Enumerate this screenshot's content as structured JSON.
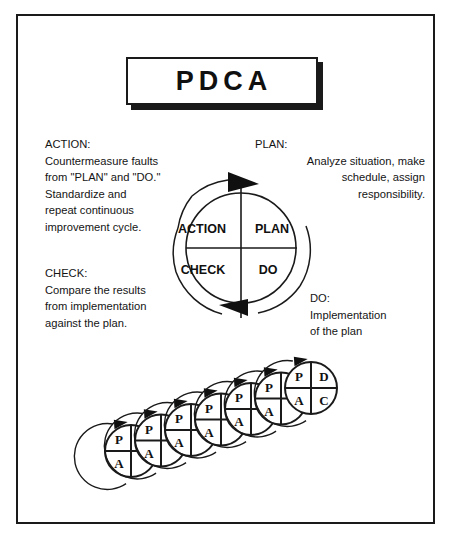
{
  "diagram": {
    "title": "PDCA",
    "frame": {
      "border_color": "#1a1a1a",
      "background": "#ffffff"
    },
    "title_box": {
      "shadow_color": "#1a1a1a",
      "fill": "#ffffff"
    }
  },
  "wheel": {
    "quadrants": [
      {
        "key": "action",
        "label": "ACTION",
        "position": "top-left"
      },
      {
        "key": "plan",
        "label": "PLAN",
        "position": "top-right"
      },
      {
        "key": "check",
        "label": "CHECK",
        "position": "bottom-left"
      },
      {
        "key": "do",
        "label": "DO",
        "position": "bottom-right"
      }
    ],
    "rotation": "clockwise"
  },
  "descriptions": {
    "action": {
      "heading": "ACTION:",
      "body": "Countermeasure faults\nfrom \"PLAN\" and \"DO.\"\nStandardize and\nrepeat continuous\nimprovement cycle."
    },
    "plan": {
      "heading": "PLAN:",
      "body": "Analyze situation, make\nschedule, assign\nresponsibility."
    },
    "check": {
      "heading": "CHECK:",
      "body": "Compare the results\nfrom implementation\nagainst the plan."
    },
    "do": {
      "heading": "DO:",
      "body": "Implementation\nof the plan"
    }
  },
  "cascade": {
    "description": "Seven overlapping PDCA wheels ascending left to right showing continuous improvement",
    "count": 7,
    "wheels": [
      {
        "index": 1,
        "visible_labels": [
          "P",
          "A"
        ],
        "hidden_labels": [
          "D",
          "C"
        ]
      },
      {
        "index": 2,
        "visible_labels": [
          "P",
          "A"
        ],
        "hidden_labels": [
          "D",
          "C"
        ]
      },
      {
        "index": 3,
        "visible_labels": [
          "P",
          "A"
        ],
        "hidden_labels": [
          "D",
          "C"
        ]
      },
      {
        "index": 4,
        "visible_labels": [
          "P",
          "A"
        ],
        "hidden_labels": [
          "D",
          "C"
        ]
      },
      {
        "index": 5,
        "visible_labels": [
          "P",
          "A"
        ],
        "hidden_labels": [
          "D",
          "C"
        ]
      },
      {
        "index": 6,
        "visible_labels": [
          "P",
          "A"
        ],
        "hidden_labels": [
          "D",
          "C"
        ]
      },
      {
        "index": 7,
        "visible_labels": [
          "P",
          "D",
          "A",
          "C"
        ],
        "hidden_labels": []
      }
    ],
    "labels": {
      "p": "P",
      "d": "D",
      "a": "A",
      "c": "C"
    }
  },
  "colors": {
    "ink": "#101010",
    "line": "#1a1a1a",
    "paper": "#ffffff"
  }
}
